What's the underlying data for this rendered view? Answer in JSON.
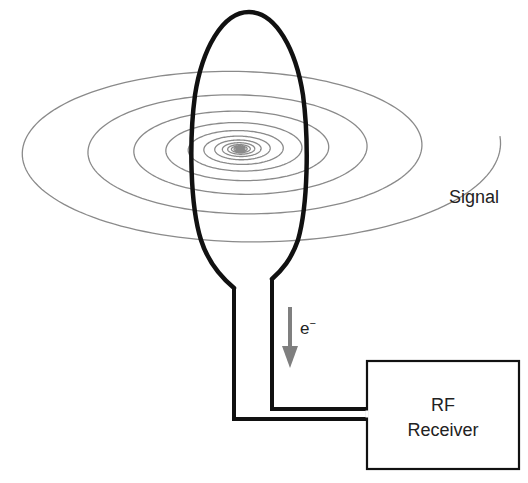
{
  "diagram": {
    "labels": {
      "signal": "Signal",
      "electron": "e",
      "electron_sup": "−",
      "receiver_line1": "RF",
      "receiver_line2": "Receiver"
    },
    "colors": {
      "background": "#ffffff",
      "loop": "#111111",
      "wire": "#111111",
      "spiral": "#8a8a8a",
      "arrow": "#7f7f7f",
      "box": "#111111",
      "text": "#222222"
    },
    "spiral": {
      "center": [
        240,
        149
      ],
      "aspect": 0.39,
      "turns": 15,
      "r_start": 1.2,
      "r_end": 262,
      "end_point": [
        497,
        152
      ]
    },
    "loop": {
      "top": [
        249,
        12
      ],
      "left_x": 193,
      "right_x": 306,
      "neck_left": [
        234,
        288
      ],
      "neck_right": [
        272,
        279
      ]
    },
    "wires": {
      "inner_bottom_y": 409,
      "outer_bottom_y": 419
    },
    "receiver_box": {
      "x": 367,
      "y": 361,
      "width": 152,
      "height": 108
    },
    "current_arrow": {
      "x": 290,
      "y1": 307,
      "y2": 367
    }
  }
}
